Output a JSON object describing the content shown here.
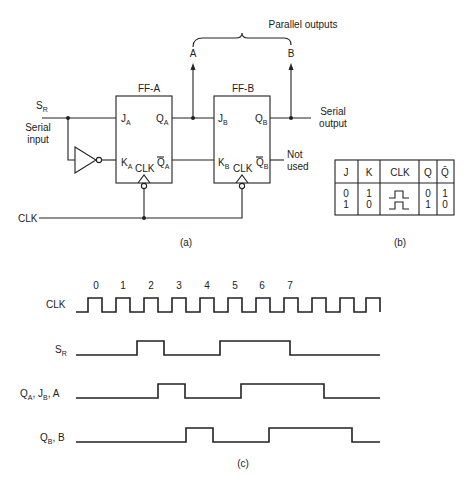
{
  "circuit": {
    "parallel_outputs_label": "Parallel outputs",
    "output_a_label": "A",
    "output_b_label": "B",
    "ff_a": {
      "title": "FF-A",
      "j": "J",
      "j_sub": "A",
      "k": "K",
      "k_sub": "A",
      "q": "Q",
      "q_sub": "A",
      "qbar": "Q",
      "qbar_sub": "A",
      "clk": "CLK"
    },
    "ff_b": {
      "title": "FF-B",
      "j": "J",
      "j_sub": "B",
      "k": "K",
      "k_sub": "B",
      "q": "Q",
      "q_sub": "B",
      "qbar": "Q",
      "qbar_sub": "B",
      "clk": "CLK"
    },
    "sr_label": "S",
    "sr_sub": "R",
    "serial_input_line1": "Serial",
    "serial_input_line2": "input",
    "serial_output_line1": "Serial",
    "serial_output_line2": "output",
    "not_used_line1": "Not",
    "not_used_line2": "used",
    "clk_label": "CLK",
    "caption": "(a)"
  },
  "truth_table": {
    "headers": [
      "J",
      "K",
      "CLK",
      "Q",
      "Q̄"
    ],
    "rows": [
      [
        "0",
        "1",
        "pulse",
        "0",
        "1"
      ],
      [
        "1",
        "0",
        "pulse",
        "1",
        "0"
      ]
    ],
    "caption": "(b)"
  },
  "timing": {
    "clock_numbers": [
      "0",
      "1",
      "2",
      "3",
      "4",
      "5",
      "6",
      "7"
    ],
    "labels": {
      "clk": "CLK",
      "sr": "S",
      "sr_sub": "R",
      "qa": "Q",
      "qa_sub": "A",
      "jb": "J",
      "jb_sub": "B",
      "a": "A",
      "qb": "Q",
      "qb_sub": "B",
      "b": "B"
    },
    "caption": "(c)"
  }
}
